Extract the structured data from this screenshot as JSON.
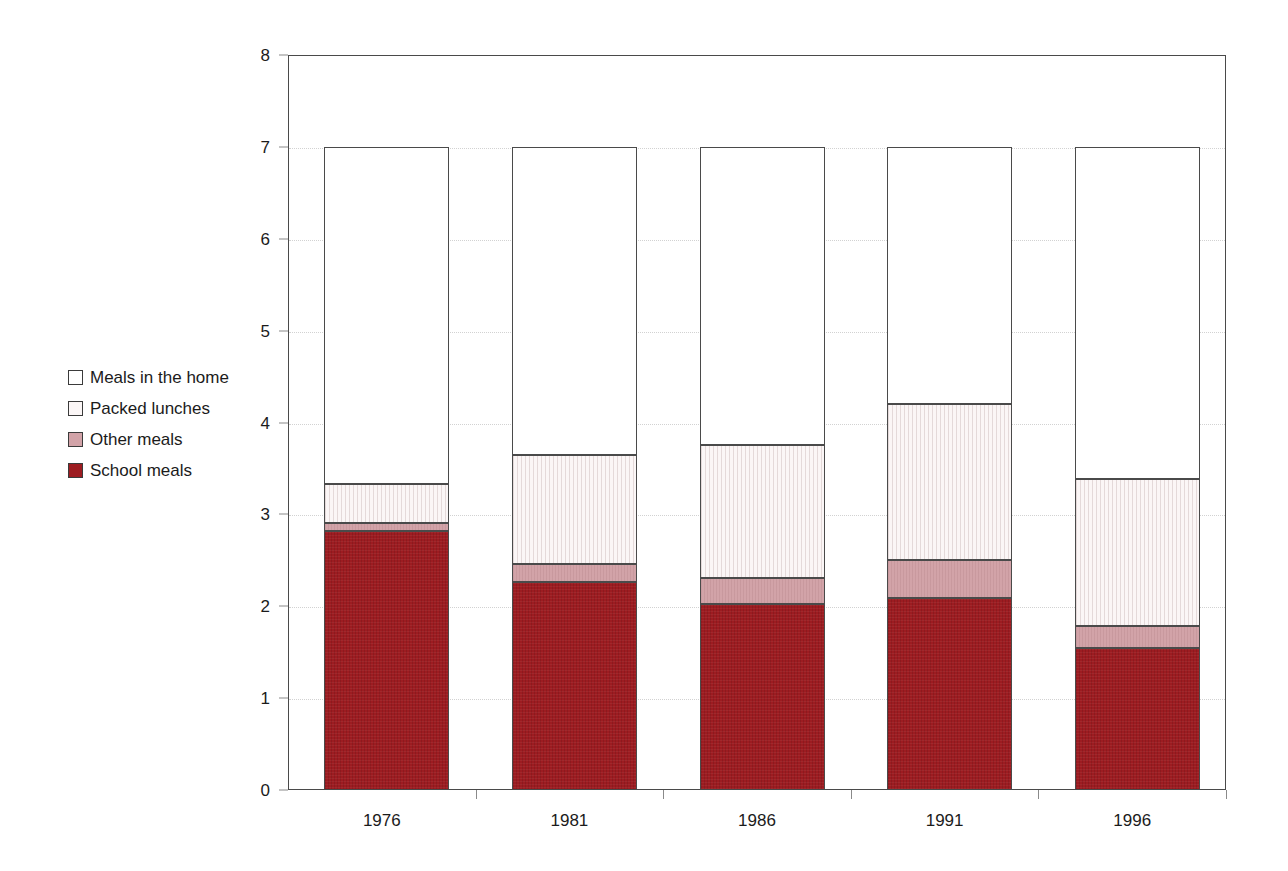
{
  "chart_data": {
    "type": "bar",
    "subtype": "stacked-vertical",
    "title": "",
    "xlabel": "",
    "ylabel": "",
    "ylim": [
      0,
      8
    ],
    "yticks": [
      0,
      1,
      2,
      3,
      4,
      5,
      6,
      7,
      8
    ],
    "ytick_labels": [
      "0",
      "1",
      "2",
      "3",
      "4",
      "5",
      "6",
      "7",
      "8"
    ],
    "grid": true,
    "grid_axis": "y",
    "legend_position": "left-outside",
    "categories": [
      "1976",
      "1981",
      "1986",
      "1991",
      "1996"
    ],
    "stack_order_bottom_to_top": [
      "School meals",
      "Other meals",
      "Packed lunches",
      "Meals in the home"
    ],
    "series": [
      {
        "name": "School meals",
        "color": "#9d1c21",
        "values": [
          2.82,
          2.26,
          2.02,
          2.09,
          1.55
        ]
      },
      {
        "name": "Other meals",
        "color": "#d2a3a8",
        "values": [
          0.09,
          0.2,
          0.29,
          0.41,
          0.24
        ]
      },
      {
        "name": "Packed lunches",
        "color": "#fbf6f6",
        "values": [
          0.42,
          1.19,
          1.44,
          1.7,
          1.6
        ]
      },
      {
        "name": "Meals in the home",
        "color": "#ffffff",
        "values": [
          3.67,
          3.35,
          3.25,
          2.8,
          3.61
        ]
      }
    ],
    "cumulative_tops": {
      "School meals": [
        2.82,
        2.26,
        2.02,
        2.09,
        1.55
      ],
      "Other meals": [
        2.91,
        2.46,
        2.31,
        2.5,
        1.79
      ],
      "Packed lunches": [
        3.33,
        3.65,
        3.75,
        4.2,
        3.39
      ],
      "Meals in the home": [
        7.0,
        7.0,
        7.0,
        7.0,
        7.0
      ]
    },
    "bar_totals": [
      7.0,
      7.0,
      7.0,
      7.0,
      7.0
    ]
  },
  "legend": {
    "items": [
      {
        "label": "Meals in the home",
        "swatch": "#ffffff",
        "key": "home"
      },
      {
        "label": "Packed lunches",
        "swatch": "#fbf6f6",
        "key": "packed"
      },
      {
        "label": "Other meals",
        "swatch": "#d2a3a8",
        "key": "other"
      },
      {
        "label": "School meals",
        "swatch": "#9d1c21",
        "key": "school"
      }
    ]
  },
  "axes": {
    "y_labels": [
      "8",
      "7",
      "6",
      "5",
      "4",
      "3",
      "2",
      "1",
      "0"
    ],
    "x_labels": [
      "1976",
      "1981",
      "1986",
      "1991",
      "1996"
    ]
  }
}
